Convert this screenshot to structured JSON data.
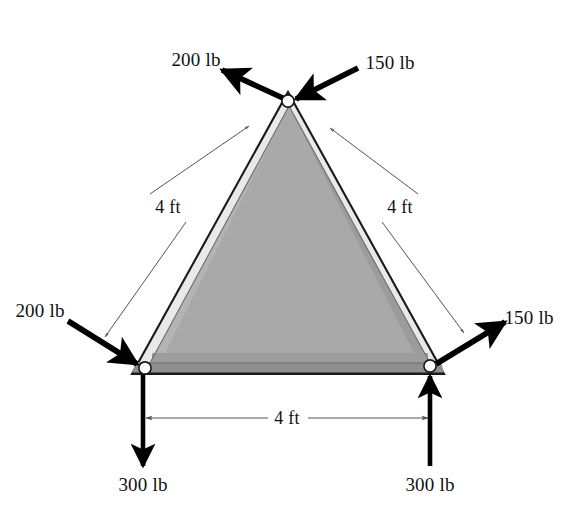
{
  "figure": {
    "type": "truss-free-body-diagram",
    "shape": "equilateral-triangle",
    "background_color": "#ffffff"
  },
  "colors": {
    "member_fill": "#e9e9e9",
    "inner_fill": "#a9a9a9",
    "inner_fill_dark": "#9a9a9a",
    "bottom_member": "#8f8f8f",
    "outline": "#1a1a1a",
    "arrow": "#000000",
    "dimension_line": "#555555",
    "joint_fill": "#ffffff",
    "text": "#111111"
  },
  "joints": [
    {
      "name": "apex-joint",
      "x": 288,
      "y": 101
    },
    {
      "name": "bottom-left-joint",
      "x": 143,
      "y": 370
    },
    {
      "name": "bottom-right-joint",
      "x": 432,
      "y": 368
    }
  ],
  "forces": [
    {
      "id": "apex-left-force",
      "label": "200 lb",
      "magnitude": 200,
      "unit": "lb",
      "joint": "apex-joint",
      "direction": "up-left",
      "sense": "outward",
      "label_x": 196,
      "label_y": 59
    },
    {
      "id": "apex-right-force",
      "label": "150 lb",
      "magnitude": 150,
      "unit": "lb",
      "joint": "apex-joint",
      "direction": "down-left",
      "sense": "inward",
      "label_x": 390,
      "label_y": 62
    },
    {
      "id": "bottom-left-diagonal-force",
      "label": "200 lb",
      "magnitude": 200,
      "unit": "lb",
      "joint": "bottom-left-joint",
      "direction": "down-right",
      "sense": "inward",
      "label_x": 40,
      "label_y": 310
    },
    {
      "id": "bottom-right-diagonal-force",
      "label": "150 lb",
      "magnitude": 150,
      "unit": "lb",
      "joint": "bottom-right-joint",
      "direction": "up-right",
      "sense": "outward",
      "label_x": 529,
      "label_y": 317
    },
    {
      "id": "bottom-left-vertical-force",
      "label": "300 lb",
      "magnitude": 300,
      "unit": "lb",
      "joint": "bottom-left-joint",
      "direction": "down",
      "sense": "outward",
      "label_x": 143,
      "label_y": 484
    },
    {
      "id": "bottom-right-vertical-force",
      "label": "300 lb",
      "magnitude": 300,
      "unit": "lb",
      "joint": "bottom-right-joint",
      "direction": "up",
      "sense": "inward",
      "label_x": 430,
      "label_y": 484
    }
  ],
  "dimensions": [
    {
      "id": "left-member-dimension",
      "label": "4 ft",
      "value": 4,
      "unit": "ft",
      "member": "left-member",
      "label_x": 168,
      "label_y": 207
    },
    {
      "id": "right-member-dimension",
      "label": "4 ft",
      "value": 4,
      "unit": "ft",
      "member": "right-member",
      "label_x": 400,
      "label_y": 207
    },
    {
      "id": "bottom-member-dimension",
      "label": "4 ft",
      "value": 4,
      "unit": "ft",
      "member": "bottom-member",
      "label_x": 287,
      "label_y": 418
    }
  ]
}
